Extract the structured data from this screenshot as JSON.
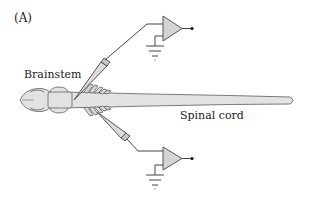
{
  "figure": {
    "panel_label": "(A)",
    "labels": {
      "brainstem": "Brainstem",
      "spinal_cord": "Spinal cord"
    },
    "components": {
      "preparation": "brainstem-spinal-cord",
      "electrodes": [
        "dorsal-suction-electrode",
        "ventral-suction-electrode"
      ],
      "amplifiers": [
        "dorsal-amplifier",
        "ventral-amplifier"
      ]
    },
    "colors": {
      "tissue_fill": "#e2e2e2",
      "tissue_stroke": "#7a7a7a",
      "amplifier_fill": "#d4d4d4",
      "line": "#444444",
      "text": "#222222"
    }
  }
}
